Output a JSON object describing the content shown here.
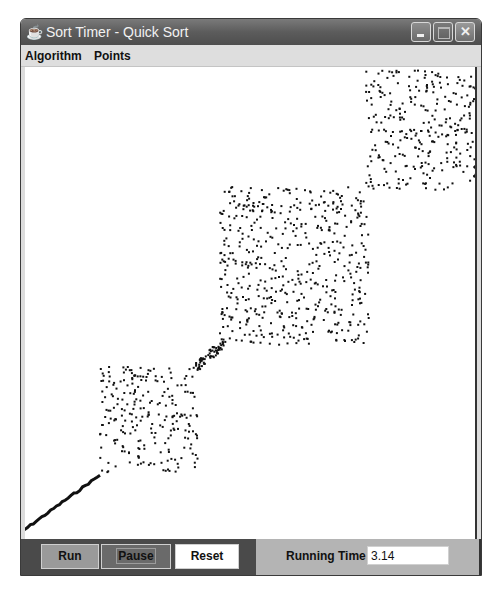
{
  "window": {
    "title": "Sort Timer - Quick Sort",
    "app_icon": "java-cup-icon",
    "controls": [
      "minimize",
      "maximize",
      "close"
    ]
  },
  "menubar": {
    "items": [
      {
        "label": "Algorithm"
      },
      {
        "label": "Points"
      }
    ]
  },
  "canvas": {
    "description": "Quick sort visualization: points sorted along diagonal, unsorted partitions shown as scattered blocks",
    "point_color": "#111111",
    "regions": [
      {
        "name": "sorted-diagonal-line",
        "x0": 13,
        "y0": 538,
        "x1": 100,
        "y1": 475
      },
      {
        "name": "partition-block-lower",
        "x": 100,
        "y": 367,
        "w": 98,
        "h": 108
      },
      {
        "name": "cluster-small",
        "x": 196,
        "y": 342,
        "w": 28,
        "h": 26
      },
      {
        "name": "partition-block-middle",
        "x": 220,
        "y": 187,
        "w": 150,
        "h": 158
      },
      {
        "name": "partition-block-upper",
        "x": 366,
        "y": 70,
        "w": 114,
        "h": 120
      }
    ]
  },
  "controls": {
    "run_label": "Run",
    "pause_label": "Pause",
    "reset_label": "Reset",
    "running_time_label": "Running Time",
    "running_time_value": "3.14"
  }
}
